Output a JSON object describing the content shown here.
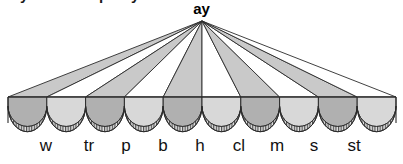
{
  "figure": {
    "title_label": "ay",
    "type": "onset-rime-fan-diagram",
    "apex": {
      "x": 202,
      "y": 21
    },
    "springline_y": 97,
    "left_edge": 8,
    "right_edge": 396,
    "colors": {
      "ray_fill_gray": "#c9c9c9",
      "ray_fill_white": "#ffffff",
      "arch_dark": "#b0b0b0",
      "arch_light": "#d8d8d8",
      "stroke": "#2b2b2b",
      "hatch": "#5a5a5a",
      "background": "#ffffff",
      "text": "#111111"
    },
    "arch_count": 10,
    "arch_fills": [
      "dark",
      "light",
      "dark",
      "light",
      "dark",
      "light",
      "dark",
      "light",
      "dark",
      "light"
    ],
    "ray_fills": [
      "gray",
      "white",
      "gray",
      "white",
      "gray",
      "white",
      "gray",
      "white",
      "gray",
      "white"
    ]
  },
  "onsets": [
    {
      "label": "w",
      "x": 46
    },
    {
      "label": "tr",
      "x": 89
    },
    {
      "label": "p",
      "x": 126
    },
    {
      "label": "b",
      "x": 163
    },
    {
      "label": "h",
      "x": 200
    },
    {
      "label": "cl",
      "x": 239
    },
    {
      "label": "m",
      "x": 277
    },
    {
      "label": "s",
      "x": 314
    },
    {
      "label": "st",
      "x": 354
    }
  ],
  "top_crop": {
    "fragments": [
      {
        "text": "y",
        "x": 20
      },
      {
        "text": "p",
        "x": 99
      },
      {
        "text": "y",
        "x": 131
      }
    ]
  }
}
